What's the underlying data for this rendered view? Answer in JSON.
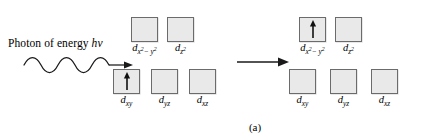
{
  "figure": {
    "caption": "(a)",
    "photon_text_prefix": "Photon of energy ",
    "photon_symbol": "hν",
    "photon_icon": "wavy-arrow-right",
    "reaction_icon": "arrow-right",
    "box_fill_color": "#e9e9e9",
    "box_border_color": "#6b6b6b",
    "spin_icon": "up-arrow",
    "background_color": "#ffffff"
  },
  "left_diagram": {
    "name": "ground-state-d-orbitals",
    "upper_set": [
      {
        "label_base": "d",
        "sub": "x",
        "sup": "2",
        "sub_tail": "− y",
        "sup_tail": "2",
        "electron_spin_up": false
      },
      {
        "label_base": "d",
        "sub": "z",
        "sup": "2",
        "sub_tail": "",
        "sup_tail": "",
        "electron_spin_up": false
      }
    ],
    "lower_set": [
      {
        "label_base": "d",
        "sub": "xy",
        "electron_spin_up": true
      },
      {
        "label_base": "d",
        "sub": "yz",
        "electron_spin_up": false
      },
      {
        "label_base": "d",
        "sub": "xz",
        "electron_spin_up": false
      }
    ]
  },
  "right_diagram": {
    "name": "excited-state-d-orbitals",
    "upper_set": [
      {
        "label_base": "d",
        "sub": "x",
        "sup": "2",
        "sub_tail": "− y",
        "sup_tail": "2",
        "electron_spin_up": true
      },
      {
        "label_base": "d",
        "sub": "z",
        "sup": "2",
        "sub_tail": "",
        "sup_tail": "",
        "electron_spin_up": false
      }
    ],
    "lower_set": [
      {
        "label_base": "d",
        "sub": "xy",
        "electron_spin_up": false
      },
      {
        "label_base": "d",
        "sub": "yz",
        "electron_spin_up": false
      },
      {
        "label_base": "d",
        "sub": "xz",
        "electron_spin_up": false
      }
    ]
  }
}
